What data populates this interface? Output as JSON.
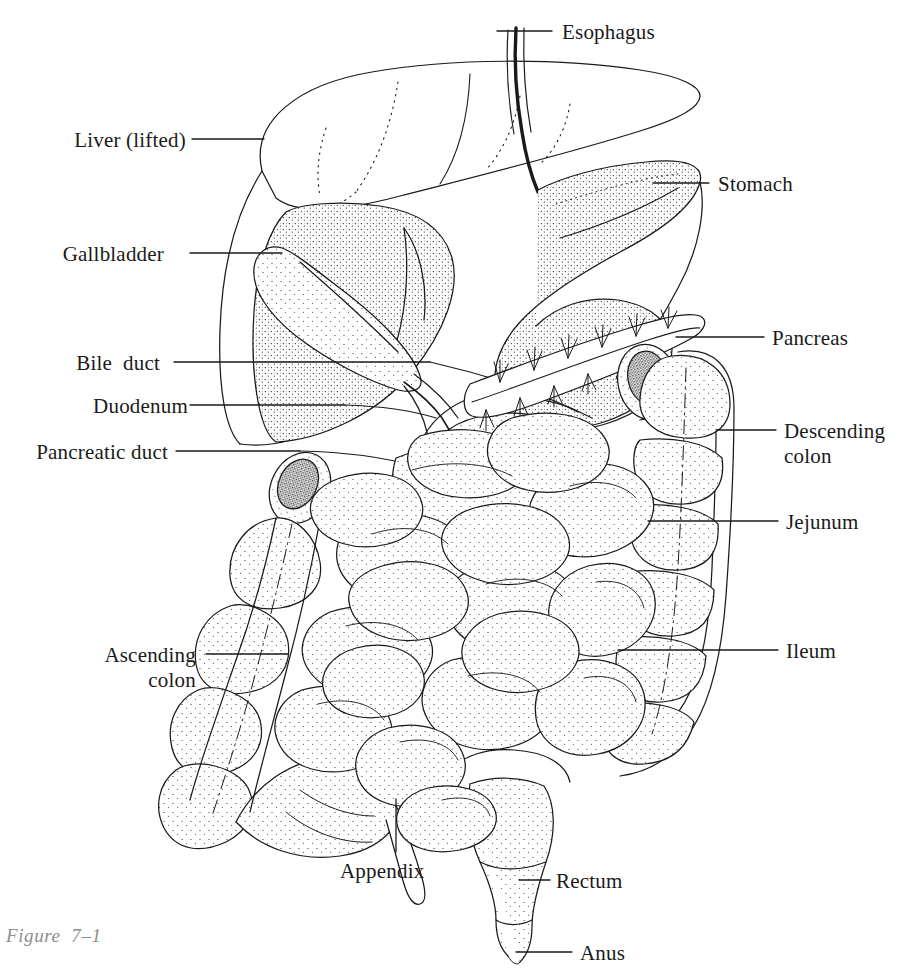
{
  "figure": {
    "caption": "Figure  7–1",
    "style": "stipple pen-and-ink line drawing",
    "background_color": "#ffffff",
    "ink_color": "#1a1a1a",
    "caption_color": "#8d8d8d"
  },
  "labels": [
    {
      "id": "esophagus",
      "text": "Esophagus",
      "side": "right",
      "text_x": 562,
      "text_y": 20,
      "line_x1": 497,
      "line_x2": 552,
      "line_y": 31
    },
    {
      "id": "liver-lifted",
      "text": "Liver (lifted)",
      "side": "left",
      "text_right": 186,
      "text_y": 128,
      "line_x1": 192,
      "line_x2": 264,
      "line_y": 139
    },
    {
      "id": "stomach",
      "text": "Stomach",
      "side": "right",
      "text_x": 718,
      "text_y": 172,
      "line_x1": 653,
      "line_x2": 709,
      "line_y": 183
    },
    {
      "id": "gallbladder",
      "text": "Gallbladder",
      "side": "left",
      "text_right": 164,
      "text_y": 242,
      "line_x1": 190,
      "line_x2": 282,
      "line_y": 253
    },
    {
      "id": "pancreas",
      "text": "Pancreas",
      "side": "right",
      "text_x": 772,
      "text_y": 326,
      "line_x1": 676,
      "line_x2": 764,
      "line_y": 337
    },
    {
      "id": "bile-duct",
      "text": "Bile  duct",
      "side": "left",
      "text_right": 160,
      "text_y": 351,
      "line_x1": 174,
      "line_x2": 430,
      "line_y": 362
    },
    {
      "id": "duodenum",
      "text": "Duodenum",
      "side": "left",
      "text_right": 188,
      "text_y": 394,
      "line_x1": 190,
      "line_x2": 345,
      "line_y": 405
    },
    {
      "id": "descending-colon",
      "text": "Descending\ncolon",
      "side": "right",
      "text_x": 784,
      "text_y": 419,
      "line_x1": 716,
      "line_x2": 776,
      "line_y": 430
    },
    {
      "id": "pancreatic-duct",
      "text": "Pancreatic duct",
      "side": "left",
      "text_right": 168,
      "text_y": 440,
      "line_x1": 176,
      "line_x2": 300,
      "line_y": 451
    },
    {
      "id": "jejunum",
      "text": "Jejunum",
      "side": "right",
      "text_x": 786,
      "text_y": 510,
      "line_x1": 648,
      "line_x2": 778,
      "line_y": 521
    },
    {
      "id": "ileum",
      "text": "Ileum",
      "side": "right",
      "text_x": 786,
      "text_y": 639,
      "line_x1": 618,
      "line_x2": 778,
      "line_y": 650
    },
    {
      "id": "ascending-colon",
      "text": "Ascending\ncolon",
      "side": "left",
      "text_right": 196,
      "text_y": 643,
      "line_x1": 206,
      "line_x2": 288,
      "line_y": 654
    },
    {
      "id": "appendix",
      "text": "Appendix",
      "side": "below",
      "text_x": 340,
      "text_y": 859,
      "line_x1": 396,
      "line_x2": 396,
      "line_y": 799
    },
    {
      "id": "rectum",
      "text": "Rectum",
      "side": "right",
      "text_x": 556,
      "text_y": 869,
      "line_x1": 519,
      "line_x2": 550,
      "line_y": 880
    },
    {
      "id": "anus",
      "text": "Anus",
      "side": "right",
      "text_x": 580,
      "text_y": 941,
      "line_x1": 516,
      "line_x2": 572,
      "line_y": 952
    }
  ]
}
